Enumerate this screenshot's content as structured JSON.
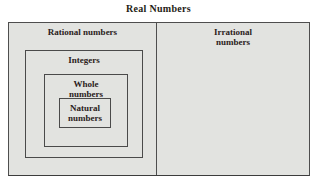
{
  "title": "Real Numbers",
  "sets": {
    "rational": {
      "label": "Rational numbers"
    },
    "integers": {
      "label": "Integers"
    },
    "whole": {
      "label": "Whole numbers"
    },
    "natural": {
      "label": "Natural numbers"
    },
    "irrational": {
      "label": "Irrational numbers"
    }
  },
  "colors": {
    "background": "#ffffff",
    "box_fill": "#e2e3e0",
    "border": "#4e4e4e",
    "text": "#2b211b"
  }
}
